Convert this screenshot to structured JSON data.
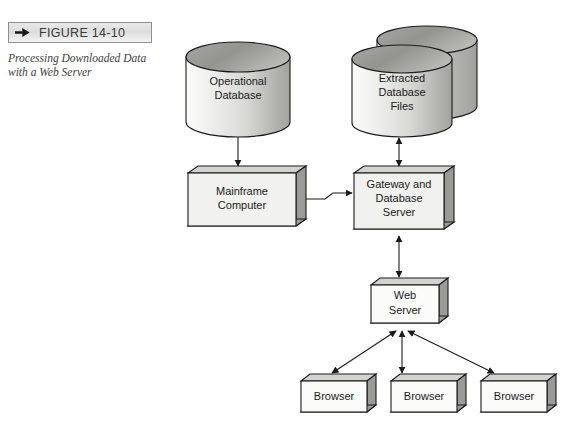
{
  "figure": {
    "arrow_icon": "right-triangle-arrow-icon",
    "number": "FIGURE 14-10",
    "caption_line1": "Processing Downloaded Data",
    "caption_line2": "with a Web Server"
  },
  "diagram": {
    "type": "flow-diagram",
    "title": "Processing Downloaded Data with a Web Server",
    "nodes": [
      {
        "id": "operational-database",
        "shape": "cylinder",
        "label_lines": [
          "Operational",
          "Database"
        ],
        "x": 186,
        "y": 42,
        "w": 104,
        "h": 94
      },
      {
        "id": "extracted-database-files",
        "shape": "cylinder-stack",
        "stack_count": 2,
        "label_lines": [
          "Extracted",
          "Database",
          "Files"
        ],
        "x": 352,
        "y": 44,
        "w": 100,
        "h": 92
      },
      {
        "id": "mainframe-computer",
        "shape": "box3d",
        "label_lines": [
          "Mainframe",
          "Computer"
        ],
        "x": 188,
        "y": 168,
        "w": 108,
        "h": 58
      },
      {
        "id": "gateway-database-server",
        "shape": "box3d",
        "label_lines": [
          "Gateway and",
          "Database",
          "Server"
        ],
        "x": 354,
        "y": 168,
        "w": 90,
        "h": 62
      },
      {
        "id": "web-server",
        "shape": "box3d",
        "label_lines": [
          "Web",
          "Server"
        ],
        "x": 371,
        "y": 279,
        "w": 68,
        "h": 43
      },
      {
        "id": "browser-1",
        "shape": "box3d",
        "label_lines": [
          "Browser"
        ],
        "x": 301,
        "y": 375,
        "w": 66,
        "h": 37
      },
      {
        "id": "browser-2",
        "shape": "box3d",
        "label_lines": [
          "Browser"
        ],
        "x": 391,
        "y": 375,
        "w": 66,
        "h": 37
      },
      {
        "id": "browser-3",
        "shape": "box3d",
        "label_lines": [
          "Browser"
        ],
        "x": 481,
        "y": 375,
        "w": 66,
        "h": 37
      }
    ],
    "edges": [
      {
        "id": "opdb-to-mainframe",
        "from": "operational-database",
        "to": "mainframe-computer",
        "arrows": "single"
      },
      {
        "id": "mainframe-to-gateway",
        "from": "mainframe-computer",
        "to": "gateway-database-server",
        "arrows": "single",
        "style": "stepped"
      },
      {
        "id": "gateway-to-extracted",
        "from": "gateway-database-server",
        "to": "extracted-database-files",
        "arrows": "double"
      },
      {
        "id": "gateway-to-webserver",
        "from": "gateway-database-server",
        "to": "web-server",
        "arrows": "double"
      },
      {
        "id": "webserver-to-browser-1",
        "from": "web-server",
        "to": "browser-1",
        "arrows": "double"
      },
      {
        "id": "webserver-to-browser-2",
        "from": "web-server",
        "to": "browser-2",
        "arrows": "double"
      },
      {
        "id": "webserver-to-browser-3",
        "from": "web-server",
        "to": "browser-3",
        "arrows": "double"
      }
    ]
  },
  "colors": {
    "page_background": "#ffffff",
    "stroke": "#1a1a1a",
    "box_face": "#f1f1ef",
    "box_top": "#d2d2cf",
    "box_side": "#9a9a97",
    "cylinder_top": "#8f8f8c",
    "cylinder_body_light": "#f4f4f2",
    "cylinder_body_dark": "#a9a9a6",
    "label_bar_border": "#8e8e8e",
    "text": "#1a1a1a"
  }
}
